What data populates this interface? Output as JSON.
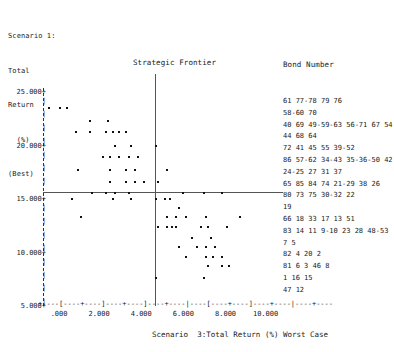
{
  "y_axis_caption": [
    "Scenario 1:",
    "Total",
    "Return",
    "  (%)",
    "(Best)"
  ],
  "plot_title": "Strategic Frontier",
  "legend": {
    "title": "Bond Number",
    "rows": [
      "61 77-78 79 76",
      "58-60 70",
      "40 69 49-59-63 56-71 67 54",
      "44 68 64",
      "72 41 45 55 39-52",
      "86 57-62 34-43 35-36-50 42",
      "24-25 27 31 37",
      "65 85 84 74 21-29 38 26",
      "80 73 75 30-32 22",
      "19",
      "66 18 33 17 13 51",
      "83 14 11 9-10 23 28 48-53",
      "7 5",
      "82 4 20 2",
      "81 6 3 46 8",
      "1 16 15",
      "47 12"
    ]
  },
  "x_axis_label": "Scenario  3:Total Return (%) Worst Case",
  "x_axis_ruler": "+----[----+----]----+----]----+----|----[----+----]----+----|----+----",
  "x_tick_labels": "   .000     2.000     4.000     6.000     8.000    10.000",
  "chart_data": {
    "type": "scatter",
    "title": "Strategic Frontier",
    "xlabel": "Scenario  3:Total Return (%) Worst Case",
    "ylabel": "Scenario 1: Total Return (%) (Best)",
    "xlim": [
      -1.0,
      11.5
    ],
    "ylim": [
      4.0,
      26.0
    ],
    "xticks": [
      0.0,
      2.0,
      4.0,
      6.0,
      8.0,
      10.0
    ],
    "xticklabels": [
      ".000",
      "2.000",
      "4.000",
      "6.000",
      "8.000",
      "10.000"
    ],
    "yticks": [
      5.0,
      10.0,
      15.0,
      20.0,
      25.0
    ],
    "yticklabels": [
      "5.000",
      "10.000",
      "15.000",
      "20.000",
      "25.000"
    ],
    "grid": false,
    "reference_lines": [
      {
        "orientation": "vertical",
        "x": 0.0,
        "style": "dashed"
      },
      {
        "orientation": "vertical",
        "x": 5.0,
        "style": "solid"
      },
      {
        "orientation": "horizontal",
        "y": 15.0,
        "style": "solid"
      }
    ],
    "points": [
      [
        0.25,
        23.5
      ],
      [
        0.75,
        23.5
      ],
      [
        1.05,
        23.5
      ],
      [
        2.05,
        22.3
      ],
      [
        2.85,
        22.3
      ],
      [
        1.45,
        21.3
      ],
      [
        2.05,
        21.3
      ],
      [
        2.75,
        21.3
      ],
      [
        3.05,
        21.3
      ],
      [
        3.35,
        21.3
      ],
      [
        3.65,
        21.3
      ],
      [
        3.15,
        20.0
      ],
      [
        3.85,
        20.0
      ],
      [
        4.95,
        20.0
      ],
      [
        2.65,
        18.9
      ],
      [
        2.95,
        18.9
      ],
      [
        3.35,
        18.9
      ],
      [
        3.75,
        18.9
      ],
      [
        4.15,
        18.9
      ],
      [
        1.55,
        17.7
      ],
      [
        2.95,
        17.7
      ],
      [
        3.65,
        17.7
      ],
      [
        4.05,
        17.7
      ],
      [
        5.45,
        17.7
      ],
      [
        2.95,
        16.6
      ],
      [
        3.65,
        16.6
      ],
      [
        4.05,
        16.6
      ],
      [
        4.45,
        16.6
      ],
      [
        5.05,
        16.6
      ],
      [
        2.15,
        15.6
      ],
      [
        2.75,
        15.6
      ],
      [
        3.15,
        15.6
      ],
      [
        3.75,
        15.6
      ],
      [
        6.15,
        15.6
      ],
      [
        7.05,
        15.6
      ],
      [
        7.85,
        15.6
      ],
      [
        1.25,
        15.0
      ],
      [
        3.05,
        15.0
      ],
      [
        3.85,
        15.0
      ],
      [
        4.95,
        15.0
      ],
      [
        5.35,
        15.0
      ],
      [
        5.55,
        15.0
      ],
      [
        5.95,
        14.2
      ],
      [
        5.45,
        13.3
      ],
      [
        5.85,
        13.3
      ],
      [
        6.25,
        13.3
      ],
      [
        7.15,
        13.3
      ],
      [
        8.65,
        13.3
      ],
      [
        1.65,
        13.3
      ],
      [
        5.05,
        12.4
      ],
      [
        5.45,
        12.4
      ],
      [
        5.65,
        12.4
      ],
      [
        5.85,
        12.4
      ],
      [
        6.95,
        12.4
      ],
      [
        7.25,
        12.4
      ],
      [
        8.05,
        12.4
      ],
      [
        6.55,
        11.4
      ],
      [
        7.35,
        11.4
      ],
      [
        5.95,
        10.5
      ],
      [
        6.75,
        10.5
      ],
      [
        7.15,
        10.5
      ],
      [
        7.55,
        10.5
      ],
      [
        6.25,
        9.6
      ],
      [
        7.15,
        9.6
      ],
      [
        7.45,
        9.6
      ],
      [
        7.85,
        9.6
      ],
      [
        7.25,
        8.7
      ],
      [
        7.85,
        8.7
      ],
      [
        8.15,
        8.7
      ],
      [
        4.95,
        7.6
      ],
      [
        7.05,
        7.6
      ]
    ]
  }
}
